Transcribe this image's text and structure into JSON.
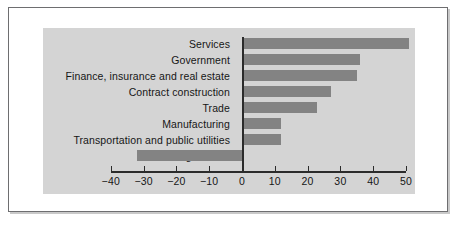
{
  "chart_data": {
    "type": "bar",
    "orientation": "horizontal",
    "title": "",
    "subtitle": "",
    "xlabel": "",
    "ylabel": "",
    "categories": [
      "Services",
      "Government",
      "Finance, insurance and real estate",
      "Contract construction",
      "Trade",
      "Manufacturing",
      "Transportation and public utilities",
      "Agriculture"
    ],
    "values": [
      51,
      36,
      35,
      27,
      23,
      12,
      12,
      -32
    ],
    "series": [
      {
        "name": "Percent change",
        "values": [
          51,
          36,
          35,
          27,
          23,
          12,
          12,
          -32
        ]
      }
    ],
    "xlim": [
      -45,
      55
    ],
    "xticks": [
      -40,
      -30,
      -20,
      -10,
      0,
      10,
      20,
      30,
      40,
      50
    ],
    "xticklabels": [
      "−40",
      "−30",
      "−20",
      "−10",
      "0",
      "10",
      "20",
      "30",
      "40",
      "50"
    ],
    "grid": false,
    "legend": false,
    "legend_position": "none",
    "bar_color": "#838383",
    "plot_background": "#d4d4d4",
    "axis_color": "#2b2b2b",
    "text_color": "#161616",
    "frame_color": "#6e6e70"
  }
}
